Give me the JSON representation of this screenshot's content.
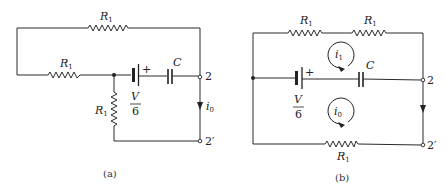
{
  "figure": {
    "panels": [
      {
        "id": "a",
        "caption": "(a)",
        "components": {
          "resistor_top": {
            "label": "R",
            "subscript": "1"
          },
          "resistor_left": {
            "label": "R",
            "subscript": "1"
          },
          "resistor_vertical": {
            "label": "R",
            "subscript": "1"
          },
          "source": {
            "numerator": "V",
            "denominator": "6",
            "polarity": "+"
          },
          "capacitor": {
            "label": "C"
          },
          "terminal_top": "2",
          "terminal_bottom": "2′",
          "current": {
            "label": "i",
            "subscript": "0"
          }
        }
      },
      {
        "id": "b",
        "caption": "(b)",
        "components": {
          "resistor_top_left": {
            "label": "R",
            "subscript": "1"
          },
          "resistor_top_right": {
            "label": "R",
            "subscript": "1"
          },
          "resistor_bottom": {
            "label": "R",
            "subscript": "1"
          },
          "source": {
            "numerator": "V",
            "denominator": "6",
            "polarity": "+"
          },
          "capacitor": {
            "label": "C"
          },
          "terminal_top": "2",
          "terminal_bottom": "2′",
          "loop_current_upper": {
            "label": "i",
            "subscript": "1"
          },
          "loop_current_lower": {
            "label": "i",
            "subscript": "0"
          }
        }
      }
    ]
  }
}
